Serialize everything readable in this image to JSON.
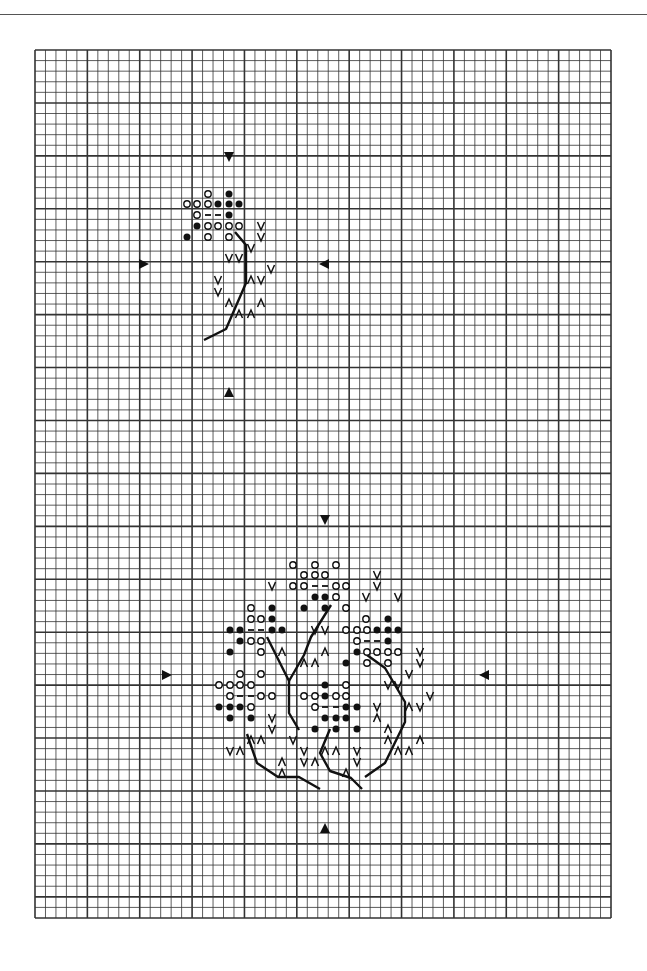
{
  "chart": {
    "type": "cross-stitch-pattern",
    "grid": {
      "left": 35,
      "top": 50,
      "right": 611,
      "bottom": 918,
      "cols": 55,
      "rows": 82,
      "bold_every": 5
    },
    "colors": {
      "ink": "#111111",
      "grid": "#333333",
      "paper": "#ffffff"
    },
    "legend_symbols": [
      "open-circle",
      "filled-circle",
      "dash",
      "v-mark",
      "caret-mark"
    ]
  },
  "motifs": [
    {
      "name": "small-leaf-sprig",
      "center_arrows": [
        {
          "dir": "down",
          "x": 229,
          "y": 157
        },
        {
          "dir": "up",
          "x": 229,
          "y": 392
        },
        {
          "dir": "right",
          "x": 144,
          "y": 264
        },
        {
          "dir": "left",
          "x": 324,
          "y": 264
        }
      ],
      "symbols": [
        {
          "s": "o",
          "x": 208,
          "y": 194
        },
        {
          "s": "f",
          "x": 229,
          "y": 194
        },
        {
          "s": "o",
          "x": 187,
          "y": 204
        },
        {
          "s": "o",
          "x": 197,
          "y": 204
        },
        {
          "s": "o",
          "x": 208,
          "y": 204
        },
        {
          "s": "f",
          "x": 218,
          "y": 204
        },
        {
          "s": "f",
          "x": 229,
          "y": 204
        },
        {
          "s": "f",
          "x": 239,
          "y": 204
        },
        {
          "s": "o",
          "x": 197,
          "y": 215
        },
        {
          "s": "-",
          "x": 208,
          "y": 215
        },
        {
          "s": "-",
          "x": 218,
          "y": 215
        },
        {
          "s": "f",
          "x": 229,
          "y": 215
        },
        {
          "s": "f",
          "x": 197,
          "y": 226
        },
        {
          "s": "o",
          "x": 208,
          "y": 226
        },
        {
          "s": "o",
          "x": 218,
          "y": 226
        },
        {
          "s": "o",
          "x": 229,
          "y": 226
        },
        {
          "s": "o",
          "x": 239,
          "y": 226
        },
        {
          "s": "v",
          "x": 261,
          "y": 226
        },
        {
          "s": "f",
          "x": 187,
          "y": 237
        },
        {
          "s": "o",
          "x": 208,
          "y": 237
        },
        {
          "s": "o",
          "x": 229,
          "y": 237
        },
        {
          "s": "v",
          "x": 261,
          "y": 237
        },
        {
          "s": "v",
          "x": 251,
          "y": 248
        },
        {
          "s": "v",
          "x": 229,
          "y": 258
        },
        {
          "s": "v",
          "x": 239,
          "y": 258
        },
        {
          "s": "v",
          "x": 271,
          "y": 269
        },
        {
          "s": "v",
          "x": 218,
          "y": 280
        },
        {
          "s": "^",
          "x": 251,
          "y": 280
        },
        {
          "s": "v",
          "x": 261,
          "y": 280
        },
        {
          "s": "v",
          "x": 218,
          "y": 292
        },
        {
          "s": "^",
          "x": 229,
          "y": 303
        },
        {
          "s": "^",
          "x": 261,
          "y": 303
        },
        {
          "s": "^",
          "x": 239,
          "y": 314
        },
        {
          "s": "^",
          "x": 251,
          "y": 314
        }
      ],
      "stems": [
        [
          [
            235,
            232
          ],
          [
            246,
            245
          ],
          [
            246,
            283
          ],
          [
            226,
            329
          ],
          [
            204,
            340
          ]
        ]
      ]
    },
    {
      "name": "large-leaf-cluster",
      "center_arrows": [
        {
          "dir": "down",
          "x": 325,
          "y": 520
        },
        {
          "dir": "up",
          "x": 325,
          "y": 828
        },
        {
          "dir": "right",
          "x": 167,
          "y": 675
        },
        {
          "dir": "left",
          "x": 484,
          "y": 675
        }
      ],
      "symbols": [
        {
          "s": "o",
          "x": 293,
          "y": 565
        },
        {
          "s": "o",
          "x": 315,
          "y": 565
        },
        {
          "s": "o",
          "x": 336,
          "y": 565
        },
        {
          "s": "o",
          "x": 304,
          "y": 575
        },
        {
          "s": "o",
          "x": 315,
          "y": 575
        },
        {
          "s": "o",
          "x": 325,
          "y": 575
        },
        {
          "s": "v",
          "x": 377,
          "y": 575
        },
        {
          "s": "v",
          "x": 272,
          "y": 586
        },
        {
          "s": "o",
          "x": 293,
          "y": 586
        },
        {
          "s": "o",
          "x": 304,
          "y": 586
        },
        {
          "s": "-",
          "x": 315,
          "y": 586
        },
        {
          "s": "-",
          "x": 325,
          "y": 586
        },
        {
          "s": "o",
          "x": 336,
          "y": 586
        },
        {
          "s": "o",
          "x": 346,
          "y": 586
        },
        {
          "s": "v",
          "x": 377,
          "y": 586
        },
        {
          "s": "f",
          "x": 315,
          "y": 597
        },
        {
          "s": "f",
          "x": 325,
          "y": 597
        },
        {
          "s": "o",
          "x": 336,
          "y": 597
        },
        {
          "s": "v",
          "x": 366,
          "y": 597
        },
        {
          "s": "v",
          "x": 398,
          "y": 597
        },
        {
          "s": "o",
          "x": 251,
          "y": 608
        },
        {
          "s": "f",
          "x": 272,
          "y": 608
        },
        {
          "s": "f",
          "x": 304,
          "y": 608
        },
        {
          "s": "f",
          "x": 325,
          "y": 608
        },
        {
          "s": "o",
          "x": 346,
          "y": 608
        },
        {
          "s": "o",
          "x": 251,
          "y": 619
        },
        {
          "s": "o",
          "x": 261,
          "y": 619
        },
        {
          "s": "f",
          "x": 272,
          "y": 619
        },
        {
          "s": "o",
          "x": 366,
          "y": 619
        },
        {
          "s": "f",
          "x": 388,
          "y": 619
        },
        {
          "s": "f",
          "x": 230,
          "y": 630
        },
        {
          "s": "f",
          "x": 240,
          "y": 630
        },
        {
          "s": "-",
          "x": 251,
          "y": 630
        },
        {
          "s": "-",
          "x": 261,
          "y": 630
        },
        {
          "s": "f",
          "x": 272,
          "y": 630
        },
        {
          "s": "f",
          "x": 282,
          "y": 630
        },
        {
          "s": "v",
          "x": 315,
          "y": 630
        },
        {
          "s": "v",
          "x": 325,
          "y": 630
        },
        {
          "s": "o",
          "x": 346,
          "y": 630
        },
        {
          "s": "o",
          "x": 357,
          "y": 630
        },
        {
          "s": "o",
          "x": 367,
          "y": 630
        },
        {
          "s": "f",
          "x": 377,
          "y": 630
        },
        {
          "s": "f",
          "x": 388,
          "y": 630
        },
        {
          "s": "f",
          "x": 398,
          "y": 630
        },
        {
          "s": "f",
          "x": 240,
          "y": 641
        },
        {
          "s": "o",
          "x": 251,
          "y": 641
        },
        {
          "s": "o",
          "x": 261,
          "y": 641
        },
        {
          "s": "o",
          "x": 357,
          "y": 641
        },
        {
          "s": "-",
          "x": 367,
          "y": 641
        },
        {
          "s": "-",
          "x": 377,
          "y": 641
        },
        {
          "s": "f",
          "x": 388,
          "y": 641
        },
        {
          "s": "f",
          "x": 230,
          "y": 652
        },
        {
          "s": "o",
          "x": 261,
          "y": 652
        },
        {
          "s": "^",
          "x": 282,
          "y": 652
        },
        {
          "s": "^",
          "x": 325,
          "y": 652
        },
        {
          "s": "f",
          "x": 357,
          "y": 652
        },
        {
          "s": "o",
          "x": 367,
          "y": 652
        },
        {
          "s": "o",
          "x": 377,
          "y": 652
        },
        {
          "s": "o",
          "x": 388,
          "y": 652
        },
        {
          "s": "o",
          "x": 398,
          "y": 652
        },
        {
          "s": "v",
          "x": 420,
          "y": 652
        },
        {
          "s": "^",
          "x": 304,
          "y": 663
        },
        {
          "s": "^",
          "x": 315,
          "y": 663
        },
        {
          "s": "f",
          "x": 346,
          "y": 663
        },
        {
          "s": "o",
          "x": 367,
          "y": 663
        },
        {
          "s": "o",
          "x": 388,
          "y": 663
        },
        {
          "s": "v",
          "x": 420,
          "y": 663
        },
        {
          "s": "o",
          "x": 240,
          "y": 674
        },
        {
          "s": "o",
          "x": 261,
          "y": 674
        },
        {
          "s": "v",
          "x": 409,
          "y": 674
        },
        {
          "s": "o",
          "x": 219,
          "y": 685
        },
        {
          "s": "o",
          "x": 230,
          "y": 685
        },
        {
          "s": "o",
          "x": 240,
          "y": 685
        },
        {
          "s": "o",
          "x": 251,
          "y": 685
        },
        {
          "s": "f",
          "x": 325,
          "y": 685
        },
        {
          "s": "o",
          "x": 346,
          "y": 685
        },
        {
          "s": "v",
          "x": 388,
          "y": 685
        },
        {
          "s": "v",
          "x": 398,
          "y": 685
        },
        {
          "s": "o",
          "x": 230,
          "y": 696
        },
        {
          "s": "-",
          "x": 240,
          "y": 696
        },
        {
          "s": "-",
          "x": 251,
          "y": 696
        },
        {
          "s": "o",
          "x": 261,
          "y": 696
        },
        {
          "s": "o",
          "x": 272,
          "y": 696
        },
        {
          "s": "o",
          "x": 304,
          "y": 696
        },
        {
          "s": "o",
          "x": 315,
          "y": 696
        },
        {
          "s": "f",
          "x": 325,
          "y": 696
        },
        {
          "s": "o",
          "x": 336,
          "y": 696
        },
        {
          "s": "o",
          "x": 346,
          "y": 696
        },
        {
          "s": "v",
          "x": 430,
          "y": 696
        },
        {
          "s": "f",
          "x": 219,
          "y": 707
        },
        {
          "s": "f",
          "x": 230,
          "y": 707
        },
        {
          "s": "f",
          "x": 240,
          "y": 707
        },
        {
          "s": "o",
          "x": 251,
          "y": 707
        },
        {
          "s": "o",
          "x": 315,
          "y": 707
        },
        {
          "s": "-",
          "x": 325,
          "y": 707
        },
        {
          "s": "-",
          "x": 336,
          "y": 707
        },
        {
          "s": "f",
          "x": 346,
          "y": 707
        },
        {
          "s": "f",
          "x": 357,
          "y": 707
        },
        {
          "s": "v",
          "x": 377,
          "y": 707
        },
        {
          "s": "^",
          "x": 409,
          "y": 707
        },
        {
          "s": "v",
          "x": 420,
          "y": 707
        },
        {
          "s": "f",
          "x": 230,
          "y": 718
        },
        {
          "s": "f",
          "x": 251,
          "y": 718
        },
        {
          "s": "v",
          "x": 272,
          "y": 718
        },
        {
          "s": "f",
          "x": 325,
          "y": 718
        },
        {
          "s": "f",
          "x": 336,
          "y": 718
        },
        {
          "s": "f",
          "x": 346,
          "y": 718
        },
        {
          "s": "^",
          "x": 377,
          "y": 718
        },
        {
          "s": "v",
          "x": 272,
          "y": 729
        },
        {
          "s": "f",
          "x": 315,
          "y": 729
        },
        {
          "s": "f",
          "x": 336,
          "y": 729
        },
        {
          "s": "f",
          "x": 357,
          "y": 729
        },
        {
          "s": "^",
          "x": 388,
          "y": 729
        },
        {
          "s": "^",
          "x": 251,
          "y": 740
        },
        {
          "s": "^",
          "x": 261,
          "y": 740
        },
        {
          "s": "v",
          "x": 293,
          "y": 740
        },
        {
          "s": "^",
          "x": 388,
          "y": 740
        },
        {
          "s": "^",
          "x": 420,
          "y": 740
        },
        {
          "s": "v",
          "x": 230,
          "y": 751
        },
        {
          "s": "^",
          "x": 240,
          "y": 751
        },
        {
          "s": "v",
          "x": 304,
          "y": 751
        },
        {
          "s": "^",
          "x": 325,
          "y": 751
        },
        {
          "s": "^",
          "x": 336,
          "y": 751
        },
        {
          "s": "v",
          "x": 357,
          "y": 751
        },
        {
          "s": "^",
          "x": 398,
          "y": 751
        },
        {
          "s": "^",
          "x": 409,
          "y": 751
        },
        {
          "s": "^",
          "x": 282,
          "y": 762
        },
        {
          "s": "v",
          "x": 304,
          "y": 762
        },
        {
          "s": "^",
          "x": 315,
          "y": 762
        },
        {
          "s": "v",
          "x": 357,
          "y": 762
        },
        {
          "s": "^",
          "x": 282,
          "y": 773
        },
        {
          "s": "^",
          "x": 346,
          "y": 773
        }
      ],
      "stems": [
        [
          [
            267,
            637
          ],
          [
            289,
            681
          ],
          [
            289,
            713
          ],
          [
            299,
            730
          ]
        ],
        [
          [
            289,
            681
          ],
          [
            304,
            655
          ],
          [
            311,
            637
          ],
          [
            331,
            605
          ]
        ],
        [
          [
            247,
            734
          ],
          [
            257,
            763
          ],
          [
            278,
            777
          ],
          [
            299,
            777
          ],
          [
            320,
            789
          ]
        ],
        [
          [
            330,
            729
          ],
          [
            320,
            753
          ],
          [
            330,
            771
          ],
          [
            351,
            778
          ],
          [
            362,
            789
          ]
        ],
        [
          [
            372,
            745
          ]
        ],
        [
          [
            367,
            655
          ],
          [
            385,
            668
          ],
          [
            405,
            702
          ],
          [
            405,
            722
          ],
          [
            385,
            763
          ],
          [
            365,
            777
          ]
        ]
      ]
    }
  ]
}
